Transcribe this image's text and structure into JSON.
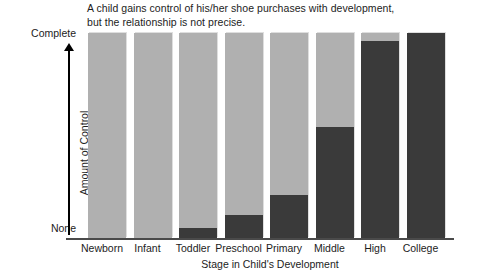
{
  "chart_data": {
    "type": "bar",
    "title": "A child gains control of his/her shoe purchases with development, but the relationship is not precise.",
    "title_lines": [
      "A child gains control of his/her shoe purchases with development,",
      "but the relationship is not precise."
    ],
    "xlabel": "Stage in Child's Development",
    "ylabel": "Amount of Control",
    "categories": [
      "Newborn",
      "Infant",
      "Toddler",
      "Preschool",
      "Primary",
      "Middle",
      "High",
      "College"
    ],
    "values": [
      0,
      0,
      5,
      11,
      21,
      54,
      96,
      100
    ],
    "ylim": [
      0,
      100
    ],
    "ytick_labels": [
      "None",
      "Complete"
    ],
    "ytick_values": [
      0,
      100
    ],
    "grid": false,
    "legend": null,
    "series": [
      {
        "name": "Amount of Control",
        "values": [
          0,
          0,
          5,
          11,
          21,
          54,
          96,
          100
        ],
        "color": "#3a3a3a"
      },
      {
        "name": "Remaining",
        "values": [
          100,
          100,
          95,
          89,
          79,
          46,
          4,
          0
        ],
        "color": "#b0b0b0"
      }
    ],
    "colors": {
      "filled": "#3a3a3a",
      "unfilled": "#b0b0b0",
      "axis": "#000000",
      "text": "#1c1c1c"
    }
  }
}
